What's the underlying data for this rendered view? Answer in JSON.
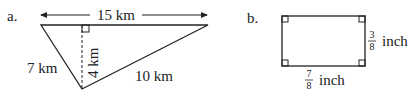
{
  "figure_a": {
    "label": "a.",
    "top_length": "15 km",
    "left_side": "7 km",
    "height": "4 km",
    "right_side": "10 km"
  },
  "figure_b": {
    "label": "b.",
    "height_num": "3",
    "height_den": "8",
    "height_unit": "inch",
    "width_num": "7",
    "width_den": "8",
    "width_unit": "inch"
  }
}
